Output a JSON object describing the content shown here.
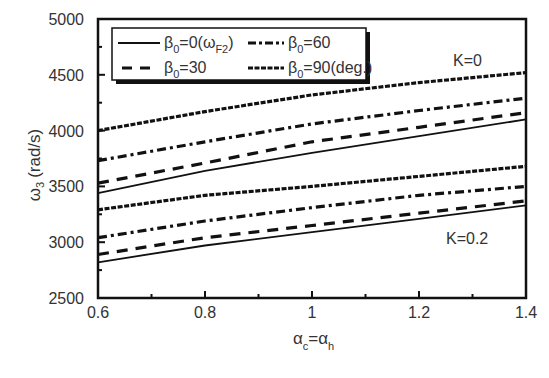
{
  "chart_data": {
    "type": "line",
    "title": "",
    "xlabel": "α_c = α_h",
    "ylabel": "ω_3 (rad/s)",
    "xlim": [
      0.6,
      1.4
    ],
    "ylim": [
      2500,
      5000
    ],
    "grid": false,
    "legend_position": "upper-left",
    "x": [
      0.6,
      0.8,
      1.0,
      1.2,
      1.4
    ],
    "x_ticks": [
      "0.6",
      "0.8",
      "1",
      "1.2",
      "1.4"
    ],
    "y_ticks": [
      "2500",
      "3000",
      "3500",
      "4000",
      "4500",
      "5000"
    ],
    "annotations": [
      {
        "text": "K=0",
        "x": 1.3,
        "y": 4720
      },
      {
        "text": "K=0.2",
        "x": 1.29,
        "y": 3110
      }
    ],
    "series": [
      {
        "name": "β0=0(ωF2)",
        "K": 0,
        "style": "solid",
        "values": [
          3440,
          3640,
          3800,
          3950,
          4100
        ]
      },
      {
        "name": "β0=30",
        "K": 0,
        "style": "dash",
        "values": [
          3530,
          3710,
          3900,
          4030,
          4160
        ]
      },
      {
        "name": "β0=60",
        "K": 0,
        "style": "dashdot",
        "values": [
          3730,
          3900,
          4060,
          4180,
          4290
        ]
      },
      {
        "name": "β0=90(deg.)",
        "K": 0,
        "style": "shortdash",
        "values": [
          4000,
          4170,
          4320,
          4430,
          4520
        ]
      },
      {
        "name": "β0=0(ωF2)",
        "K": 0.2,
        "style": "solid",
        "values": [
          2820,
          2970,
          3090,
          3210,
          3330
        ]
      },
      {
        "name": "β0=30",
        "K": 0.2,
        "style": "dash",
        "values": [
          2890,
          3040,
          3150,
          3260,
          3370
        ]
      },
      {
        "name": "β0=60",
        "K": 0.2,
        "style": "dashdot",
        "values": [
          3040,
          3190,
          3310,
          3420,
          3500
        ]
      },
      {
        "name": "β0=90(deg.)",
        "K": 0.2,
        "style": "shortdash",
        "values": [
          3290,
          3420,
          3500,
          3590,
          3680
        ]
      }
    ]
  },
  "labels": {
    "ylabel_main": "ω",
    "ylabel_sub": "3",
    "ylabel_unit": "(rad/s)",
    "xlabel_a1": "α",
    "xlabel_s1": "c",
    "xlabel_eq": "=α",
    "xlabel_s2": "h",
    "k0": "K=0",
    "k02": "K=0.2"
  },
  "legend": {
    "items": [
      {
        "beta": "β",
        "sub": "0",
        "text": "=0(ω",
        "sub2": "F2",
        "close": ")"
      },
      {
        "beta": "β",
        "sub": "0",
        "text": "=30"
      },
      {
        "beta": "β",
        "sub": "0",
        "text": "=60"
      },
      {
        "beta": "β",
        "sub": "0",
        "text": "=90(deg.)"
      }
    ]
  }
}
